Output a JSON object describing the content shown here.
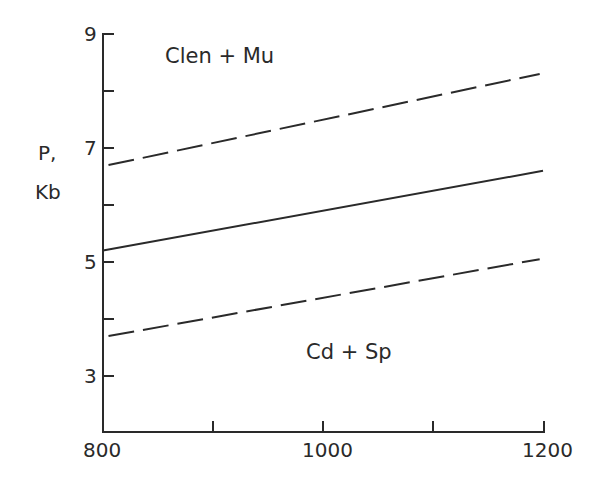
{
  "chart_data": {
    "type": "line",
    "title": "",
    "xlabel": "",
    "ylabel": "P, Kb",
    "ylabel_lines": [
      "P,",
      "Kb"
    ],
    "xlim": [
      800,
      1200
    ],
    "ylim": [
      2,
      9
    ],
    "x_ticks": [
      800,
      900,
      1000,
      1100,
      1200
    ],
    "x_tick_labels": [
      "800",
      "",
      "1000",
      "",
      "1200"
    ],
    "y_ticks": [
      3,
      4,
      5,
      6,
      7,
      8,
      9
    ],
    "y_tick_labels": [
      "3",
      "",
      "5",
      "",
      "7",
      "",
      "9"
    ],
    "grid": false,
    "legend": null,
    "series": [
      {
        "name": "upper bound (dashed)",
        "style": "dashed",
        "x": [
          805,
          1197
        ],
        "values": [
          6.7,
          8.3
        ]
      },
      {
        "name": "reaction boundary (solid)",
        "style": "solid",
        "x": [
          800,
          1200
        ],
        "values": [
          5.2,
          6.6
        ]
      },
      {
        "name": "lower bound (dashed)",
        "style": "dashed",
        "x": [
          805,
          1197
        ],
        "values": [
          3.7,
          5.05
        ]
      }
    ],
    "annotations": [
      {
        "text": "Clen + Mu",
        "x": 880,
        "y": 8.6,
        "region": "high-pressure field"
      },
      {
        "text": "Cd + Sp",
        "x": 1000,
        "y": 3.6,
        "region": "low-pressure field"
      }
    ]
  },
  "labels": {
    "y_axis_p": "P,",
    "y_axis_kb": "Kb",
    "field_top": "Clen + Mu",
    "field_bottom": "Cd + Sp",
    "x800": "800",
    "x1000": "1000",
    "x1200": "1200",
    "y9": "9",
    "y7": "7",
    "y5": "5",
    "y3": "3"
  },
  "colors": {
    "ink": "#2a2a2a",
    "background": "#ffffff"
  }
}
